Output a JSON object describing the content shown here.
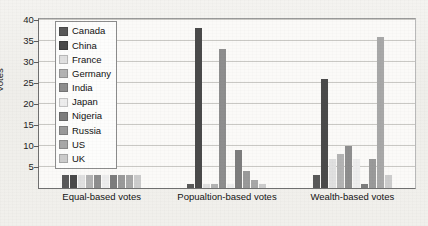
{
  "chart_data": {
    "type": "bar",
    "title": "",
    "xlabel": "",
    "ylabel": "Votes",
    "ylim": [
      0,
      40
    ],
    "yticks": [
      0,
      5,
      10,
      15,
      20,
      25,
      30,
      35,
      40
    ],
    "ytick_labels": [
      "",
      "5",
      "10",
      "15",
      "20",
      "25",
      "30",
      "35",
      "40"
    ],
    "grid": true,
    "legend_position": "upper-left-inside",
    "categories": [
      "Equal-based votes",
      "Popualtion-based votes",
      "Wealth-based votes"
    ],
    "series": [
      {
        "name": "Canada",
        "color": "#595959",
        "values": [
          3,
          1,
          3
        ]
      },
      {
        "name": "China",
        "color": "#4a4a4a",
        "values": [
          3,
          38,
          26
        ]
      },
      {
        "name": "France",
        "color": "#e0e0e0",
        "values": [
          3,
          1,
          7
        ]
      },
      {
        "name": "Germany",
        "color": "#b3b3b3",
        "values": [
          3,
          1,
          8
        ]
      },
      {
        "name": "India",
        "color": "#8e8e8e",
        "values": [
          3,
          33,
          10
        ]
      },
      {
        "name": "Japan",
        "color": "#ededed",
        "values": [
          3,
          1,
          7
        ]
      },
      {
        "name": "Nigeria",
        "color": "#7d7d7d",
        "values": [
          3,
          9,
          1
        ]
      },
      {
        "name": "Russia",
        "color": "#9a9a9a",
        "values": [
          3,
          4,
          7
        ]
      },
      {
        "name": "US",
        "color": "#a8a8a8",
        "values": [
          3,
          2,
          36
        ]
      },
      {
        "name": "UK",
        "color": "#cccccc",
        "values": [
          3,
          1,
          3
        ]
      }
    ]
  }
}
